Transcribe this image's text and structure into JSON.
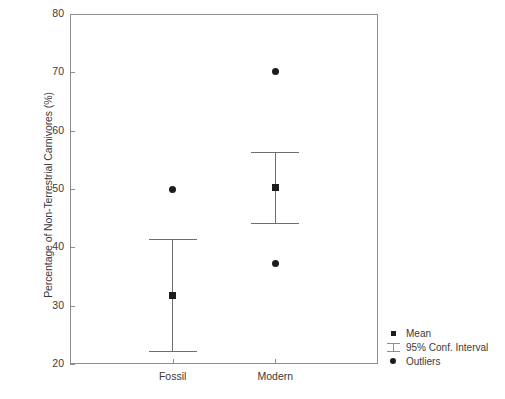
{
  "chart_data": {
    "type": "scatter",
    "title": "",
    "xlabel": "",
    "ylabel": "Percentage of Non-Terrestrial Carnivores (%)",
    "categories": [
      "Fossil",
      "Modern"
    ],
    "ylim": [
      20,
      80
    ],
    "yticks": [
      20,
      30,
      40,
      50,
      60,
      70,
      80
    ],
    "ytick_labels": [
      "20",
      "30",
      "40",
      "50",
      "60",
      "70",
      "80"
    ],
    "grid": false,
    "legend_position": "outside-bottom-right",
    "legend": [
      {
        "key": "mean-square",
        "label": "Mean"
      },
      {
        "key": "conf-interval-bar",
        "label": "95% Conf. Interval"
      },
      {
        "key": "outlier-circle",
        "label": "Outliers"
      }
    ],
    "groups": [
      {
        "name": "Fossil",
        "mean": 31.7,
        "ci_low": 22.3,
        "ci_high": 41.4,
        "outliers": [
          50.0
        ]
      },
      {
        "name": "Modern",
        "mean": 50.3,
        "ci_low": 44.1,
        "ci_high": 56.4,
        "outliers": [
          70.2,
          37.3
        ]
      }
    ],
    "colors": {
      "marker": "#1c1c1c",
      "interval": "#6e6e6e",
      "axis": "#8e8e8e",
      "text": "#3a3a3a",
      "background": "#ffffff"
    }
  }
}
